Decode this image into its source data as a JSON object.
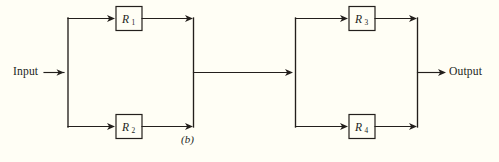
{
  "figure": {
    "caption": "(b)",
    "input_label": "Input",
    "output_label": "Output",
    "colors": {
      "background": "#fffef5",
      "ink": "#231f1c"
    }
  },
  "blocks": [
    {
      "id": "left-parallel-group",
      "branches": [
        {
          "id": "r1",
          "label": "R",
          "subscript": "1"
        },
        {
          "id": "r2",
          "label": "R",
          "subscript": "2"
        }
      ]
    },
    {
      "id": "right-parallel-group",
      "branches": [
        {
          "id": "r3",
          "label": "R",
          "subscript": "3"
        },
        {
          "id": "r4",
          "label": "R",
          "subscript": "4"
        }
      ]
    }
  ],
  "diagram_data": {
    "type": "reliability-block-diagram",
    "description": "Two parallel blocks connected in series. Each parallel block contains two redundant components.",
    "component_count": 4,
    "components": [
      "R1",
      "R2",
      "R3",
      "R4"
    ],
    "topology": "(R1 || R2) in series with (R3 || R4)",
    "terminals": {
      "in": "Input",
      "out": "Output"
    }
  }
}
